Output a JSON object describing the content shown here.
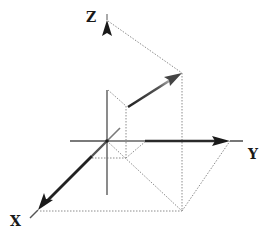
{
  "diagram": {
    "labels": {
      "x": "X",
      "y": "Y",
      "z": "Z"
    },
    "colors": {
      "axis": "#333333",
      "axis_light": "#8a8a8a",
      "vector": "#3a3a3a",
      "guide": "#8c8c8c",
      "background": "#ffffff"
    },
    "points": {
      "origin": [
        107,
        141
      ],
      "z_tip": [
        107,
        20
      ],
      "y_tip": [
        230,
        141
      ],
      "x_tip": [
        38,
        210
      ],
      "vector_start": [
        128,
        107
      ],
      "vector_end": [
        182,
        73
      ],
      "floor_corner": [
        182,
        211
      ],
      "inner_corner": [
        126,
        158
      ]
    }
  }
}
